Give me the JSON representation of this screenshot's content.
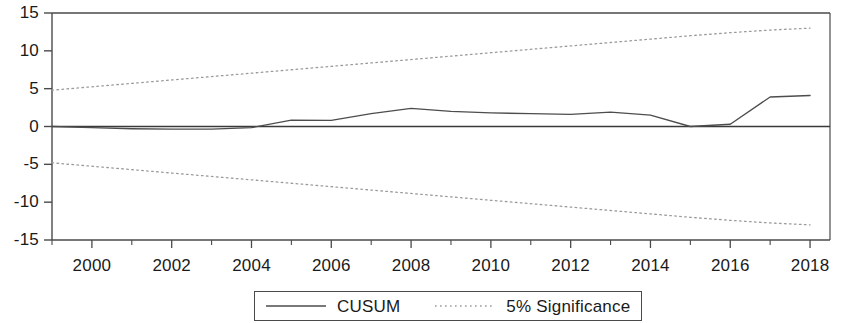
{
  "chart_data": {
    "type": "line",
    "title": "",
    "xlabel": "",
    "ylabel": "",
    "xlim": [
      1999,
      2018.5
    ],
    "ylim": [
      -15,
      15
    ],
    "grid": false,
    "legend_position": "bottom-center",
    "x_ticks_major": [
      2000,
      2002,
      2004,
      2006,
      2008,
      2010,
      2012,
      2014,
      2016,
      2018
    ],
    "x_ticks_minor": [
      1999,
      2001,
      2003,
      2005,
      2007,
      2009,
      2011,
      2013,
      2015,
      2017
    ],
    "y_ticks": [
      15,
      10,
      5,
      0,
      -5,
      -10,
      -15
    ],
    "x": [
      1999,
      2000,
      2001,
      2002,
      2003,
      2004,
      2005,
      2006,
      2007,
      2008,
      2009,
      2010,
      2011,
      2012,
      2013,
      2014,
      2015,
      2016,
      2017,
      2018
    ],
    "series": [
      {
        "name": "CUSUM",
        "style": "solid",
        "color": "#4d4d4d",
        "values": [
          0.0,
          -0.15,
          -0.3,
          -0.35,
          -0.35,
          -0.15,
          0.85,
          0.8,
          1.7,
          2.4,
          2.0,
          1.8,
          1.7,
          1.6,
          1.9,
          1.5,
          0.0,
          0.3,
          3.9,
          4.1
        ]
      },
      {
        "name": "5% Significance Upper",
        "style": "dotted",
        "color": "#9b9b9b",
        "values": [
          4.8,
          5.25,
          5.7,
          6.15,
          6.6,
          7.05,
          7.5,
          7.95,
          8.4,
          8.85,
          9.3,
          9.75,
          10.2,
          10.65,
          11.1,
          11.55,
          12.0,
          12.4,
          12.75,
          13.0
        ]
      },
      {
        "name": "5% Significance Lower",
        "style": "dotted",
        "color": "#9b9b9b",
        "values": [
          -4.8,
          -5.25,
          -5.7,
          -6.15,
          -6.6,
          -7.05,
          -7.5,
          -7.95,
          -8.4,
          -8.85,
          -9.3,
          -9.75,
          -10.2,
          -10.65,
          -11.1,
          -11.55,
          -12.0,
          -12.4,
          -12.75,
          -13.0
        ]
      }
    ],
    "legend": [
      {
        "label": "CUSUM",
        "style": "solid",
        "color": "#4d4d4d"
      },
      {
        "label": "5%  Significance",
        "style": "dotted",
        "color": "#9b9b9b"
      }
    ],
    "y_tick_labels": [
      "15",
      "10",
      "5",
      "0",
      "-5",
      "-10",
      "-15"
    ],
    "x_tick_labels": [
      "2000",
      "2002",
      "2004",
      "2006",
      "2008",
      "2010",
      "2012",
      "2014",
      "2016",
      "2018"
    ],
    "zero_line": 0,
    "axis_color": "#4a4a4a"
  }
}
